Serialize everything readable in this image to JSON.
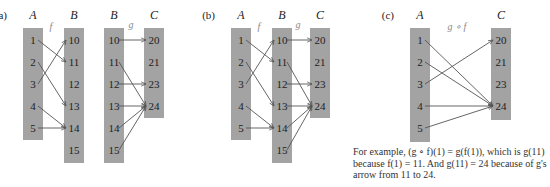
{
  "panels": [
    {
      "id": "a",
      "label": "(a)",
      "columns": [
        {
          "name": "A",
          "x": 23,
          "top": 28,
          "bottom": 140,
          "items": [
            "1",
            "2",
            "3",
            "4",
            "5"
          ]
        },
        {
          "name": "B",
          "x": 64,
          "top": 28,
          "bottom": 163,
          "items": [
            "10",
            "11",
            "12",
            "13",
            "14",
            "15"
          ]
        },
        {
          "name": "B",
          "x": 104,
          "top": 28,
          "bottom": 163,
          "items": [
            "10",
            "11",
            "12",
            "13",
            "14",
            "15"
          ]
        },
        {
          "name": "C",
          "x": 144,
          "top": 28,
          "bottom": 118,
          "items": [
            "20",
            "21",
            "23",
            "24"
          ]
        }
      ],
      "function_labels": [
        {
          "text": "f",
          "x": 51,
          "y": 30
        },
        {
          "text": "g",
          "x": 131,
          "y": 28
        }
      ],
      "arrows": [
        {
          "from": [
            0,
            0
          ],
          "to": [
            1,
            1
          ]
        },
        {
          "from": [
            0,
            1
          ],
          "to": [
            1,
            3
          ]
        },
        {
          "from": [
            0,
            2
          ],
          "to": [
            1,
            0
          ]
        },
        {
          "from": [
            0,
            3
          ],
          "to": [
            1,
            4
          ]
        },
        {
          "from": [
            0,
            4
          ],
          "to": [
            1,
            4
          ]
        },
        {
          "from": [
            2,
            0
          ],
          "to": [
            3,
            0
          ]
        },
        {
          "from": [
            2,
            1
          ],
          "to": [
            3,
            3
          ]
        },
        {
          "from": [
            2,
            2
          ],
          "to": [
            3,
            2
          ]
        },
        {
          "from": [
            2,
            3
          ],
          "to": [
            3,
            3
          ]
        },
        {
          "from": [
            2,
            4
          ],
          "to": [
            3,
            3
          ]
        },
        {
          "from": [
            2,
            5
          ],
          "to": [
            3,
            3
          ]
        }
      ]
    },
    {
      "id": "b",
      "label": "(b)",
      "columns": [
        {
          "name": "A",
          "x": 231,
          "top": 28,
          "bottom": 140,
          "items": [
            "1",
            "2",
            "3",
            "4",
            "5"
          ]
        },
        {
          "name": "B",
          "x": 272,
          "top": 28,
          "bottom": 163,
          "items": [
            "10",
            "11",
            "12",
            "13",
            "14",
            "15"
          ]
        },
        {
          "name": "C",
          "x": 310,
          "top": 28,
          "bottom": 118,
          "items": [
            "20",
            "21",
            "23",
            "24"
          ]
        }
      ],
      "function_labels": [
        {
          "text": "f",
          "x": 259,
          "y": 30
        },
        {
          "text": "g",
          "x": 298,
          "y": 28
        }
      ],
      "arrows": [
        {
          "from": [
            0,
            0
          ],
          "to": [
            1,
            1
          ]
        },
        {
          "from": [
            0,
            1
          ],
          "to": [
            1,
            3
          ]
        },
        {
          "from": [
            0,
            2
          ],
          "to": [
            1,
            0
          ]
        },
        {
          "from": [
            0,
            3
          ],
          "to": [
            1,
            4
          ]
        },
        {
          "from": [
            0,
            4
          ],
          "to": [
            1,
            4
          ]
        },
        {
          "from": [
            1,
            0
          ],
          "to": [
            2,
            0
          ]
        },
        {
          "from": [
            1,
            1
          ],
          "to": [
            2,
            3
          ]
        },
        {
          "from": [
            1,
            2
          ],
          "to": [
            2,
            2
          ]
        },
        {
          "from": [
            1,
            3
          ],
          "to": [
            2,
            3
          ]
        },
        {
          "from": [
            1,
            4
          ],
          "to": [
            2,
            3
          ]
        },
        {
          "from": [
            1,
            5
          ],
          "to": [
            2,
            3
          ]
        }
      ]
    },
    {
      "id": "c",
      "label": "(c)",
      "columns": [
        {
          "name": "A",
          "x": 410,
          "top": 28,
          "bottom": 142,
          "items": [
            "1",
            "2",
            "3",
            "4",
            "5"
          ]
        },
        {
          "name": "C",
          "x": 491,
          "top": 28,
          "bottom": 120,
          "items": [
            "20",
            "21",
            "23",
            "24"
          ]
        }
      ],
      "function_labels": [
        {
          "text": "g ∘ f",
          "x": 457,
          "y": 30
        }
      ],
      "arrows": [
        {
          "from": [
            0,
            0
          ],
          "to": [
            1,
            3
          ]
        },
        {
          "from": [
            0,
            1
          ],
          "to": [
            1,
            3
          ]
        },
        {
          "from": [
            0,
            2
          ],
          "to": [
            1,
            0
          ]
        },
        {
          "from": [
            0,
            3
          ],
          "to": [
            1,
            3
          ]
        },
        {
          "from": [
            0,
            4
          ],
          "to": [
            1,
            3
          ]
        }
      ]
    }
  ],
  "caption": "For example, (g ∘ f)(1) = g(f(1)), which is g(11) because f(1) = 11. And g(11) = 24 because of g's arrow from 11 to 24.",
  "colors": {
    "bar": "#a3a3a3",
    "arrow": "#555555",
    "text": "#222222"
  }
}
